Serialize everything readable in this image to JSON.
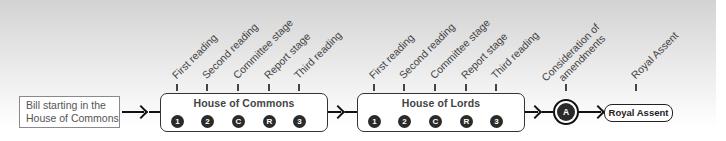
{
  "start": {
    "line1": "Bill starting in the",
    "line2": "House of Commons"
  },
  "houses": [
    {
      "title": "House of Commons",
      "stages": [
        {
          "label": "First reading",
          "badge": "1"
        },
        {
          "label": "Second reading",
          "badge": "2"
        },
        {
          "label": "Committee stage",
          "badge": "C"
        },
        {
          "label": "Report stage",
          "badge": "R"
        },
        {
          "label": "Third reading",
          "badge": "3"
        }
      ]
    },
    {
      "title": "House of Lords",
      "stages": [
        {
          "label": "First reading",
          "badge": "1"
        },
        {
          "label": "Second reading",
          "badge": "2"
        },
        {
          "label": "Committee stage",
          "badge": "C"
        },
        {
          "label": "Report stage",
          "badge": "R"
        },
        {
          "label": "Third reading",
          "badge": "3"
        }
      ]
    }
  ],
  "amendments": {
    "label_line1": "Consideration of",
    "label_line2": "amendments",
    "badge": "A"
  },
  "royal_assent": {
    "label": "Royal Assent",
    "box_label": "Royal Assent"
  },
  "colors": {
    "line": "#111111",
    "badge": "#2a2a2a",
    "text": "#444444"
  }
}
